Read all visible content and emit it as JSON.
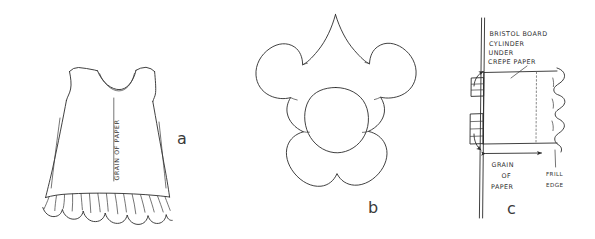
{
  "figure": {
    "background_color": "#ffffff",
    "ink_color": "#2b2b2b"
  },
  "panels": [
    {
      "id": "a",
      "letter": "a",
      "name": "sleeveless-dress-with-ruffle-hem",
      "labels": {
        "grain": "GRAIN OF PAPER"
      }
    },
    {
      "id": "b",
      "letter": "b",
      "name": "six-petal-flower-template",
      "petal_count": 6,
      "has_center_oval": true
    },
    {
      "id": "c",
      "letter": "c",
      "name": "bristol-board-cylinder-assembly",
      "labels": {
        "line1": "BRISTOL BOARD",
        "line2": "CYLINDER",
        "line3": "UNDER",
        "line4": "CREPE PAPER",
        "grain_line1": "GRAIN",
        "grain_line2": "OF",
        "grain_line3": "PAPER",
        "frill_line1": "FRILL",
        "frill_line2": "EDGE"
      }
    }
  ]
}
